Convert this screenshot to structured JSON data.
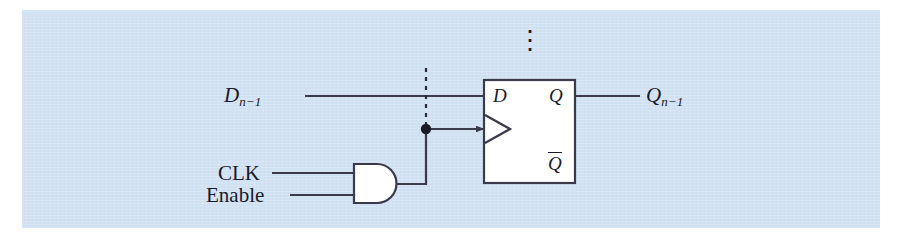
{
  "figure": {
    "background_color": "#cfe0f2",
    "line_color": "#3a3a4a",
    "text_color": "#1a1a28",
    "fill_color": "#ffffff"
  },
  "labels": {
    "data_input": {
      "base": "D",
      "subscript": "n−1"
    },
    "data_output": {
      "base": "Q",
      "subscript": "n−1"
    },
    "clock_input": "CLK",
    "enable_input": "Enable",
    "ff_port_d": "D",
    "ff_port_q": "Q",
    "ff_port_qbar": "Q",
    "continuation": "⋮"
  },
  "components": [
    {
      "name": "d-flip-flop",
      "type": "flip-flop",
      "x": 484,
      "y": 80,
      "width": 91,
      "height": 103
    },
    {
      "name": "and-gate",
      "type": "and",
      "x": 353,
      "y": 164,
      "width": 45,
      "height": 39
    }
  ],
  "nets": [
    {
      "name": "d-input-wire",
      "from": "D_{n-1}",
      "to": "flip-flop D pin"
    },
    {
      "name": "q-output-wire",
      "from": "flip-flop Q pin",
      "to": "Q_{n-1}"
    },
    {
      "name": "clk-wire",
      "from": "CLK",
      "to": "and-gate input A"
    },
    {
      "name": "enable-wire",
      "from": "Enable",
      "to": "and-gate input B"
    },
    {
      "name": "gated-clock-wire",
      "from": "and-gate output",
      "to": "flip-flop clock pin"
    },
    {
      "name": "clock-bus-dotted",
      "from": "junction",
      "to": "upper bit slices"
    }
  ]
}
